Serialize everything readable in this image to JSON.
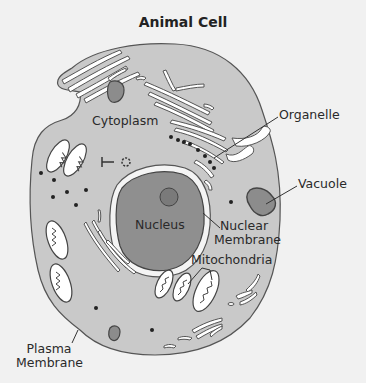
{
  "title": "Animal Cell",
  "labels": {
    "cytoplasm": "Cytoplasm",
    "organelle": "Organelle",
    "vacuole": "Vacuole",
    "nucleus": "Nucleus",
    "nuclear_membrane_line1": "Nuclear",
    "nuclear_membrane_line2": "Membrane",
    "mitochondria": "Mitochondria",
    "plasma_membrane_line1": "Plasma",
    "plasma_membrane_line2": "Membrane"
  },
  "colors": {
    "background": "#f1f1f1",
    "cytoplasm": "#c9c9c9",
    "nucleus": "#8f8f8f",
    "nucleolus": "#7a7a7a",
    "vacuole": "#8c8c8c",
    "outline": "#444444",
    "organelle_fill": "#ffffff"
  }
}
